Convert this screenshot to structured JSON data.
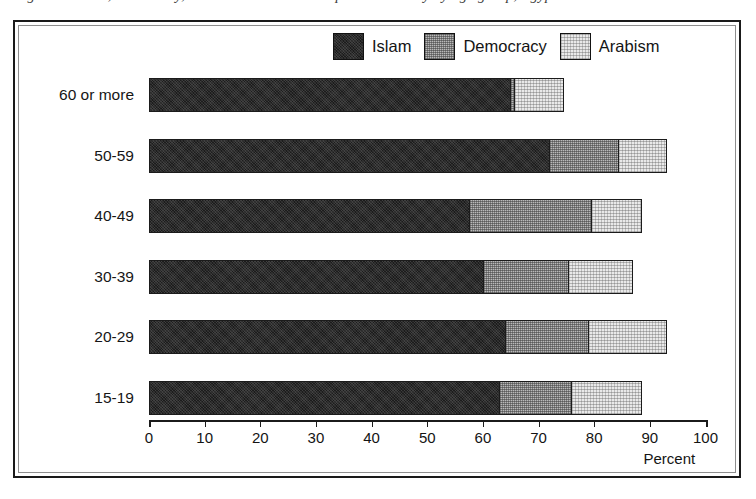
{
  "caption": {
    "text": "Figure 2. Islam, democracy, and Arabism as most important identity by age group, Egypt"
  },
  "legend": {
    "position": "top-center",
    "entries": [
      {
        "label": "Islam",
        "swatch": "dark-hatch-swatch",
        "color": "#2b2b2b"
      },
      {
        "label": "Democracy",
        "swatch": "mid-grey-hatch-swatch",
        "color": "#b9b9b9"
      },
      {
        "label": "Arabism",
        "swatch": "light-grey-hatch-swatch",
        "color": "#e9e9e9"
      }
    ]
  },
  "axis": {
    "x_title": "Percent",
    "x_ticks": [
      "0",
      "10",
      "20",
      "30",
      "40",
      "50",
      "60",
      "70",
      "80",
      "90",
      "100"
    ],
    "x_min": 0,
    "x_max": 100
  },
  "chart_data": {
    "type": "bar",
    "orientation": "horizontal",
    "stacked": true,
    "title": "",
    "subtitle": "",
    "xlabel": "Percent",
    "ylabel": "",
    "xlim": [
      0,
      100
    ],
    "ylim": null,
    "grid": false,
    "legend_position": "top-center",
    "categories": [
      "60 or more",
      "50-59",
      "40-49",
      "30-39",
      "20-29",
      "15-19"
    ],
    "series": [
      {
        "name": "Islam",
        "color": "#2b2b2b",
        "values": [
          65,
          72,
          57.5,
          60,
          64,
          63
        ]
      },
      {
        "name": "Democracy",
        "color": "#b9b9b9",
        "values": [
          0.7,
          12.5,
          22,
          15.5,
          15,
          13
        ]
      },
      {
        "name": "Arabism",
        "color": "#e9e9e9",
        "values": [
          8.8,
          8.5,
          9,
          11.5,
          14,
          12.5
        ]
      }
    ],
    "cumulative_totals": [
      74.5,
      93,
      88.5,
      87,
      93,
      88.5
    ],
    "annotations": []
  },
  "rows": [
    {
      "label": "60 or more",
      "islam": 65,
      "democracy": 0.7,
      "arabism": 8.8
    },
    {
      "label": "50-59",
      "islam": 72,
      "democracy": 12.5,
      "arabism": 8.5
    },
    {
      "label": "40-49",
      "islam": 57.5,
      "democracy": 22,
      "arabism": 9
    },
    {
      "label": "30-39",
      "islam": 60,
      "democracy": 15.5,
      "arabism": 11.5
    },
    {
      "label": "20-29",
      "islam": 64,
      "democracy": 15,
      "arabism": 14
    },
    {
      "label": "15-19",
      "islam": 63,
      "democracy": 13,
      "arabism": 12.5
    }
  ]
}
